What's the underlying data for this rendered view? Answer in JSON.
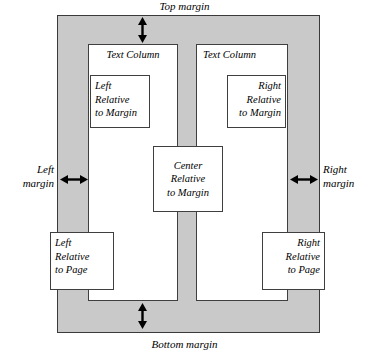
{
  "figure": {
    "name": "text-frame-anchoring-diagram",
    "page_fill_color": "#c9c9c9",
    "frame_fill_color": "#ffffff",
    "outline_color": "#3f3f3f"
  },
  "margins": {
    "top": "Top margin",
    "bottom": "Bottom margin",
    "left_line1": "Left",
    "left_line2": "margin",
    "right_line1": "Right",
    "right_line2": "margin"
  },
  "columns": [
    {
      "label": "Text Column",
      "side": "left"
    },
    {
      "label": "Text Column",
      "side": "right"
    }
  ],
  "boxes": {
    "left_relative_to_margin": {
      "line1": "Left",
      "line2": "Relative",
      "line3": "to Margin"
    },
    "right_relative_to_margin": {
      "line1": "Right",
      "line2": "Relative",
      "line3": "to Margin"
    },
    "center_relative_to_margin": {
      "line1": "Center",
      "line2": "Relative",
      "line3": "to Margin"
    },
    "left_relative_to_page": {
      "line1": "Left",
      "line2": "Relative",
      "line3": "to Page"
    },
    "right_relative_to_page": {
      "line1": "Right",
      "line2": "Relative",
      "line3": "to Page"
    }
  },
  "icons": {
    "vertical_double_arrow": "double-headed-vertical-arrow",
    "horizontal_double_arrow": "double-headed-horizontal-arrow"
  }
}
